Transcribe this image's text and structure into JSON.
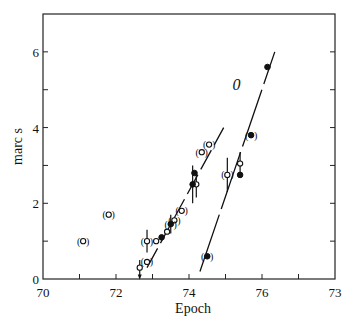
{
  "chart_data": {
    "type": "scatter",
    "title": "",
    "xlabel": "Epoch",
    "ylabel": "marc s",
    "xlim": [
      70,
      78
    ],
    "ylim": [
      0,
      7
    ],
    "x_ticks": [
      "70",
      "72",
      "74",
      "76",
      "73"
    ],
    "y_ticks": [
      "0",
      "2",
      "4",
      "6"
    ],
    "grid": false,
    "annotations": [
      {
        "text": "0",
        "x": 75.3,
        "y": 5.0
      }
    ],
    "series": [
      {
        "name": "open-circles",
        "marker": "open",
        "points": [
          {
            "x": 72.65,
            "y": 0.3,
            "err": 0.2
          },
          {
            "x": 72.85,
            "y": 0.45,
            "bracket": true
          },
          {
            "x": 72.85,
            "y": 1.0,
            "err": 0.3,
            "bracket": true
          },
          {
            "x": 73.1,
            "y": 1.0
          },
          {
            "x": 73.4,
            "y": 1.25
          },
          {
            "x": 73.6,
            "y": 1.55,
            "bracket": true
          },
          {
            "x": 73.8,
            "y": 1.8,
            "bracket": true
          },
          {
            "x": 74.2,
            "y": 2.5,
            "err": 0.35
          },
          {
            "x": 74.35,
            "y": 3.35,
            "bracket": true
          },
          {
            "x": 74.55,
            "y": 3.55,
            "bracket": true
          },
          {
            "x": 75.05,
            "y": 2.75,
            "err": 0.45,
            "bracket": true
          },
          {
            "x": 75.4,
            "y": 3.05,
            "err": 0.3
          },
          {
            "x": 71.1,
            "y": 1.0,
            "bracket": true
          },
          {
            "x": 71.8,
            "y": 1.7,
            "bracket": true
          }
        ]
      },
      {
        "name": "filled-circles",
        "marker": "filled",
        "points": [
          {
            "x": 73.25,
            "y": 1.1
          },
          {
            "x": 73.5,
            "y": 1.45,
            "err": 0.25,
            "bracket": true
          },
          {
            "x": 74.1,
            "y": 2.5,
            "err": 0.5
          },
          {
            "x": 74.15,
            "y": 2.8
          },
          {
            "x": 74.5,
            "y": 0.6,
            "bracket": true
          },
          {
            "x": 75.4,
            "y": 2.75
          },
          {
            "x": 75.7,
            "y": 3.8,
            "bracket": true
          },
          {
            "x": 76.15,
            "y": 5.6
          }
        ]
      }
    ],
    "fit_lines": [
      {
        "name": "left-dashed",
        "style": "dashed",
        "x": [
          72.85,
          74.95
        ],
        "y": [
          0.3,
          4.0
        ]
      },
      {
        "name": "right-line",
        "style": "dashed",
        "x": [
          74.3,
          76.35
        ],
        "y": [
          0.2,
          6.0
        ]
      }
    ]
  }
}
